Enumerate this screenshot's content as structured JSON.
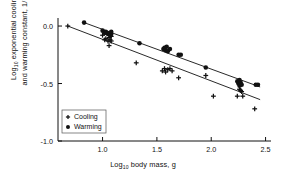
{
  "chart_data": {
    "type": "scatter",
    "title": "",
    "xlabel": "Log10 body mass, g",
    "ylabel": "Log10 exponential cooling and warming constant, 1/min",
    "xlim": [
      0.59,
      2.55
    ],
    "ylim": [
      -1.0,
      0.07
    ],
    "grid": false,
    "legend_position": "lower-left-inside",
    "xticks": [
      "1.0",
      "1.5",
      "2.0",
      "2.5"
    ],
    "xtick_values": [
      1.0,
      1.5,
      2.0,
      2.5
    ],
    "yticks": [
      "0.0",
      "-0.5",
      "-1.0"
    ],
    "ytick_values": [
      0.0,
      -0.5,
      -1.0
    ],
    "series": [
      {
        "name": "Cooling",
        "marker": "plus",
        "color": "#111111",
        "points": [
          [
            0.68,
            0.0
          ],
          [
            1.0,
            -0.08
          ],
          [
            1.02,
            -0.12
          ],
          [
            1.03,
            -0.11
          ],
          [
            1.05,
            -0.13
          ],
          [
            1.06,
            -0.1
          ],
          [
            1.06,
            -0.17
          ],
          [
            1.07,
            -0.12
          ],
          [
            1.08,
            -0.13
          ],
          [
            1.08,
            -0.09
          ],
          [
            1.31,
            -0.32
          ],
          [
            1.55,
            -0.39
          ],
          [
            1.57,
            -0.37
          ],
          [
            1.58,
            -0.4
          ],
          [
            1.6,
            -0.38
          ],
          [
            1.62,
            -0.37
          ],
          [
            1.64,
            -0.39
          ],
          [
            1.7,
            -0.45
          ],
          [
            1.95,
            -0.43
          ],
          [
            2.02,
            -0.61
          ],
          [
            2.24,
            -0.61
          ],
          [
            2.26,
            -0.55
          ],
          [
            2.27,
            -0.56
          ],
          [
            2.28,
            -0.57
          ],
          [
            2.29,
            -0.61
          ],
          [
            2.4,
            -0.72
          ]
        ]
      },
      {
        "name": "Warming",
        "marker": "circle",
        "color": "#111111",
        "points": [
          [
            0.83,
            0.03
          ],
          [
            1.0,
            -0.04
          ],
          [
            1.02,
            -0.06
          ],
          [
            1.03,
            -0.05
          ],
          [
            1.05,
            -0.07
          ],
          [
            1.06,
            -0.06
          ],
          [
            1.07,
            -0.08
          ],
          [
            1.08,
            -0.07
          ],
          [
            1.08,
            -0.05
          ],
          [
            1.34,
            -0.15
          ],
          [
            1.56,
            -0.2
          ],
          [
            1.57,
            -0.19
          ],
          [
            1.58,
            -0.21
          ],
          [
            1.59,
            -0.18
          ],
          [
            1.6,
            -0.22
          ],
          [
            1.62,
            -0.2
          ],
          [
            1.7,
            -0.25
          ],
          [
            1.72,
            -0.25
          ],
          [
            1.95,
            -0.36
          ],
          [
            2.24,
            -0.48
          ],
          [
            2.25,
            -0.5
          ],
          [
            2.26,
            -0.47
          ],
          [
            2.26,
            -0.52
          ],
          [
            2.27,
            -0.49
          ],
          [
            2.28,
            -0.51
          ],
          [
            2.41,
            -0.51
          ],
          [
            2.43,
            -0.51
          ]
        ]
      }
    ],
    "fit_lines": [
      {
        "name": "Warming fit",
        "x": [
          0.83,
          2.45
        ],
        "y": [
          0.03,
          -0.53
        ]
      },
      {
        "name": "Cooling fit",
        "x": [
          0.68,
          2.45
        ],
        "y": [
          0.0,
          -0.64
        ]
      }
    ]
  },
  "legend": {
    "items": [
      {
        "label": "Cooling",
        "marker": "plus"
      },
      {
        "label": "Warming",
        "marker": "circle"
      }
    ]
  },
  "axes": {
    "x_title_main": "Log",
    "x_title_sub": "10",
    "x_title_rest": " body mass, g",
    "y_title_main": "Log",
    "y_title_sub": "10",
    "y_title_line1_rest": " exponential cooling",
    "y_title_line2": "and warming constant, 1/min"
  }
}
